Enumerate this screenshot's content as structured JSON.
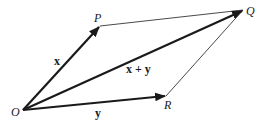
{
  "diagram": {
    "type": "vector-addition-parallelogram",
    "points": {
      "O": {
        "label": "O",
        "x": 23,
        "y": 110
      },
      "P": {
        "label": "P",
        "x": 100,
        "y": 26
      },
      "Q": {
        "label": "Q",
        "x": 243,
        "y": 10
      },
      "R": {
        "label": "R",
        "x": 166,
        "y": 96
      }
    },
    "vectors": [
      {
        "from": "O",
        "to": "P",
        "label": "x"
      },
      {
        "from": "O",
        "to": "R",
        "label": "y"
      },
      {
        "from": "O",
        "to": "Q",
        "label": "x + y"
      }
    ],
    "edges": [
      {
        "from": "P",
        "to": "Q"
      },
      {
        "from": "R",
        "to": "Q"
      }
    ],
    "colors": {
      "stroke": "#1a1a1a",
      "background": "#ffffff"
    }
  }
}
